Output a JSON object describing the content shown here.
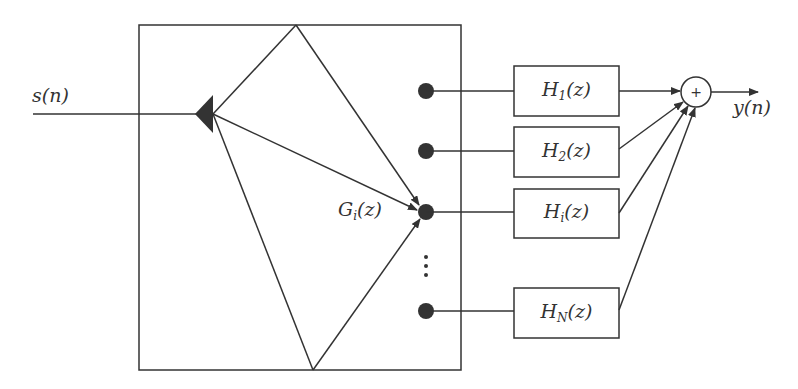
{
  "diagram": {
    "type": "block-diagram",
    "input": {
      "label": "s(n)"
    },
    "output": {
      "label": "y(n)"
    },
    "distributor": {
      "label_main": "G",
      "label_sub": "i",
      "label_tail": "(z)"
    },
    "summer": {
      "symbol": "+"
    },
    "branches": [
      {
        "main": "H",
        "sub": "1",
        "tail": "(z)"
      },
      {
        "main": "H",
        "sub": "2",
        "tail": "(z)"
      },
      {
        "main": "H",
        "sub": "i",
        "tail": "(z)"
      },
      {
        "main": "H",
        "sub": "N",
        "tail": "(z)"
      }
    ],
    "ellipsis": "⋮",
    "colors": {
      "stroke": "#333333",
      "fill": "#333333",
      "background": "#ffffff"
    }
  }
}
